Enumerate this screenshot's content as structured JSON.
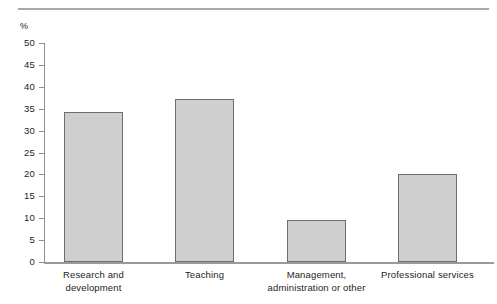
{
  "chart_data": {
    "type": "bar",
    "title": "",
    "subtitle": "",
    "xlabel": "",
    "ylabel": "%",
    "unit_label": "%",
    "categories": [
      "Research and development",
      "Teaching",
      "Management, administration or other",
      "Professional services"
    ],
    "category_lines": [
      [
        "Research and",
        "development"
      ],
      [
        "Teaching",
        ""
      ],
      [
        "Management,",
        "administration or other"
      ],
      [
        "Professional services",
        ""
      ]
    ],
    "values": [
      34.3,
      37.3,
      9.5,
      20.2
    ],
    "ylim": [
      0,
      50
    ],
    "ytick_step": 5,
    "ytick_labels": [
      "50",
      "45",
      "40",
      "35",
      "30",
      "25",
      "20",
      "15",
      "10",
      "5",
      "0"
    ],
    "ytick_values": [
      50,
      45,
      40,
      35,
      30,
      25,
      20,
      15,
      10,
      5,
      0
    ],
    "grid": false,
    "legend": null,
    "bar_fill_color": "#cfcfcf",
    "bar_border_color": "#6e6e6e",
    "axis_color": "#8f8f8f",
    "text_color": "#1d1d1d"
  }
}
